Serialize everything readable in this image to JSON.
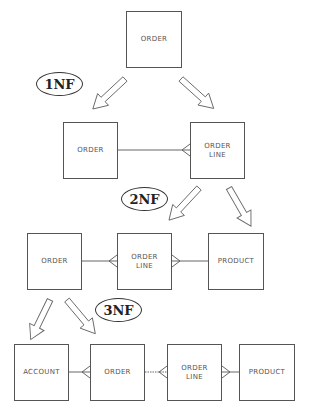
{
  "diagram": {
    "colors": {
      "line": "#555555",
      "text": "#555555",
      "label": "#222222"
    },
    "stages": [
      {
        "id": "unnormalized",
        "entities": [
          {
            "label": "ORDER"
          }
        ]
      },
      {
        "id": "1nf",
        "label": "1NF",
        "entities": [
          {
            "label": "ORDER"
          },
          {
            "label": "ORDER\nLINE"
          }
        ],
        "relationships": [
          "ORDER 1—many ORDER LINE"
        ]
      },
      {
        "id": "2nf",
        "label": "2NF",
        "entities": [
          {
            "label": "ORDER"
          },
          {
            "label": "ORDER\nLINE"
          },
          {
            "label": "PRODUCT"
          }
        ],
        "relationships": [
          "ORDER 1—many ORDER LINE",
          "PRODUCT 1—many ORDER LINE"
        ]
      },
      {
        "id": "3nf",
        "label": "3NF",
        "entities": [
          {
            "label": "ACCOUNT"
          },
          {
            "label": "ORDER"
          },
          {
            "label": "ORDER\nLINE"
          },
          {
            "label": "PRODUCT"
          }
        ],
        "relationships": [
          "ACCOUNT 1—many ORDER",
          "ORDER 1—many ORDER LINE",
          "PRODUCT 1—many ORDER LINE"
        ]
      }
    ]
  }
}
